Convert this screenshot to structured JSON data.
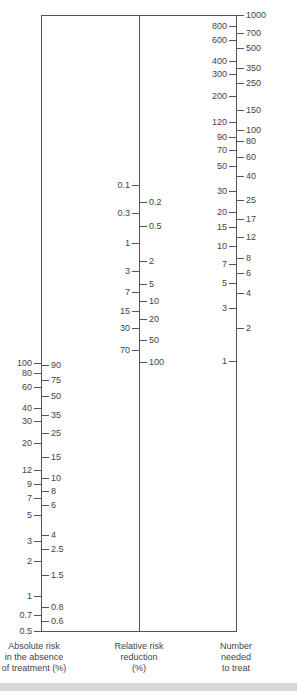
{
  "chart_data": {
    "type": "nomogram",
    "title": "",
    "axes": [
      {
        "name": "Absolute risk in the absence of treatment (%)",
        "caption_lines": [
          "Absolute risk",
          "in the absence",
          "of treatment (%)"
        ],
        "x": 41,
        "top": 15,
        "bottom": 631,
        "left_ticks": [
          {
            "v": "100",
            "y": 363
          },
          {
            "v": "80",
            "y": 373
          },
          {
            "v": "60",
            "y": 387
          },
          {
            "v": "40",
            "y": 408
          },
          {
            "v": "30",
            "y": 421
          },
          {
            "v": "20",
            "y": 443
          },
          {
            "v": "12",
            "y": 470
          },
          {
            "v": "9",
            "y": 484
          },
          {
            "v": "7",
            "y": 498
          },
          {
            "v": "5",
            "y": 515
          },
          {
            "v": "3",
            "y": 541
          },
          {
            "v": "2",
            "y": 561
          },
          {
            "v": "1",
            "y": 596
          },
          {
            "v": "0.7",
            "y": 615
          },
          {
            "v": "0.5",
            "y": 631
          }
        ],
        "right_ticks": [
          {
            "v": "90",
            "y": 365
          },
          {
            "v": "75",
            "y": 380
          },
          {
            "v": "50",
            "y": 396
          },
          {
            "v": "35",
            "y": 415
          },
          {
            "v": "25",
            "y": 433
          },
          {
            "v": "15",
            "y": 457
          },
          {
            "v": "10",
            "y": 478
          },
          {
            "v": "8",
            "y": 491
          },
          {
            "v": "6",
            "y": 505
          },
          {
            "v": "4",
            "y": 535
          },
          {
            "v": "2.5",
            "y": 549
          },
          {
            "v": "1.5",
            "y": 575
          },
          {
            "v": "0.8",
            "y": 607
          },
          {
            "v": "0.6",
            "y": 621
          }
        ]
      },
      {
        "name": "Relative risk reduction (%)",
        "caption_lines": [
          "Relative risk",
          "reduction",
          "(%)"
        ],
        "x": 139,
        "top": 15,
        "bottom": 631,
        "left_ticks": [
          {
            "v": "0.1",
            "y": 185
          },
          {
            "v": "0.3",
            "y": 213
          },
          {
            "v": "1",
            "y": 243
          },
          {
            "v": "3",
            "y": 271
          },
          {
            "v": "7",
            "y": 292
          },
          {
            "v": "15",
            "y": 311
          },
          {
            "v": "30",
            "y": 328
          },
          {
            "v": "70",
            "y": 350
          }
        ],
        "right_ticks": [
          {
            "v": "0.2",
            "y": 202
          },
          {
            "v": "0.5",
            "y": 226
          },
          {
            "v": "2",
            "y": 261
          },
          {
            "v": "5",
            "y": 284
          },
          {
            "v": "10",
            "y": 301
          },
          {
            "v": "20",
            "y": 319
          },
          {
            "v": "50",
            "y": 340
          },
          {
            "v": "100",
            "y": 362
          }
        ]
      },
      {
        "name": "Number needed to treat",
        "caption_lines": [
          "Number",
          "needed",
          "to treat"
        ],
        "x": 236,
        "top": 15,
        "bottom": 631,
        "left_ticks": [
          {
            "v": "800",
            "y": 26
          },
          {
            "v": "600",
            "y": 40
          },
          {
            "v": "400",
            "y": 61
          },
          {
            "v": "300",
            "y": 74
          },
          {
            "v": "200",
            "y": 96
          },
          {
            "v": "120",
            "y": 122
          },
          {
            "v": "90",
            "y": 137
          },
          {
            "v": "70",
            "y": 150
          },
          {
            "v": "50",
            "y": 166
          },
          {
            "v": "30",
            "y": 191
          },
          {
            "v": "20",
            "y": 212
          },
          {
            "v": "15",
            "y": 227
          },
          {
            "v": "10",
            "y": 246
          },
          {
            "v": "7",
            "y": 264
          },
          {
            "v": "5",
            "y": 283
          },
          {
            "v": "3",
            "y": 308
          },
          {
            "v": "1",
            "y": 361
          }
        ],
        "right_ticks": [
          {
            "v": "1000",
            "y": 15
          },
          {
            "v": "700",
            "y": 33
          },
          {
            "v": "500",
            "y": 48
          },
          {
            "v": "350",
            "y": 68
          },
          {
            "v": "250",
            "y": 83
          },
          {
            "v": "150",
            "y": 110
          },
          {
            "v": "100",
            "y": 130
          },
          {
            "v": "80",
            "y": 141
          },
          {
            "v": "60",
            "y": 157
          },
          {
            "v": "40",
            "y": 176
          },
          {
            "v": "25",
            "y": 200
          },
          {
            "v": "17",
            "y": 219
          },
          {
            "v": "12",
            "y": 237
          },
          {
            "v": "8",
            "y": 258
          },
          {
            "v": "6",
            "y": 273
          },
          {
            "v": "4",
            "y": 293
          },
          {
            "v": "2",
            "y": 328
          }
        ]
      }
    ],
    "frame": {
      "top_y": 15,
      "bottom_y": 631,
      "left_x": 41,
      "right_x": 236
    },
    "colors": {
      "line": "#555555",
      "text": "#444444",
      "background": "#ffffff"
    }
  }
}
